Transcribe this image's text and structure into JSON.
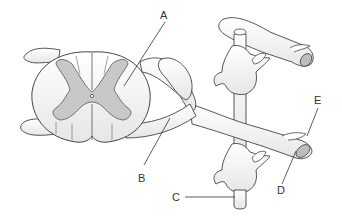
{
  "diagram": {
    "labels": {
      "A": "A",
      "B": "B",
      "C": "C",
      "D": "D",
      "E": "E"
    },
    "colors": {
      "outline": "#444444",
      "white_matter": "#ffffff",
      "gray_matter": "#c8c8c8",
      "cut_surface": "#bdbdbd",
      "label_text": "#333333"
    }
  }
}
